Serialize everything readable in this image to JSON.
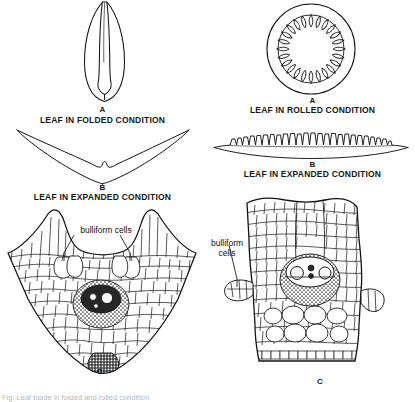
{
  "figure": {
    "title_footer": "Fig. Leaf blade in folded and rolled condition",
    "columns": [
      {
        "id": "left-column",
        "name": "folded-leaf-column",
        "panels": [
          {
            "id": "left-a",
            "letter": "A",
            "title": "LEAF IN FOLDED CONDITION",
            "shape": "folded-leaf-outline"
          },
          {
            "id": "left-b",
            "letter": "B",
            "title": "LEAF IN EXPANDED CONDITION",
            "shape": "expanded-leaf-v-outline"
          },
          {
            "id": "left-c",
            "letter": "C",
            "title": "",
            "shape": "transverse-section-folded",
            "annotations": [
              {
                "label": "bulliform cells",
                "name": "bulliform-cells-label"
              }
            ]
          }
        ]
      },
      {
        "id": "right-column",
        "name": "rolled-leaf-column",
        "panels": [
          {
            "id": "right-a",
            "letter": "A",
            "title": "LEAF IN ROLLED CONDITION",
            "shape": "rolled-leaf-circle"
          },
          {
            "id": "right-b",
            "letter": "B",
            "title": "LEAF IN EXPANDED CONDITION",
            "shape": "expanded-leaf-flat-outline"
          },
          {
            "id": "right-c",
            "letter": "C",
            "title": "",
            "shape": "transverse-section-rolled",
            "annotations": [
              {
                "label": "bulliform",
                "label2": "cells",
                "name": "bulliform-cells-label"
              }
            ]
          }
        ]
      }
    ]
  },
  "colors": {
    "ink": "#141414",
    "background": "#ffffff",
    "faint": "#bdbdbd"
  }
}
